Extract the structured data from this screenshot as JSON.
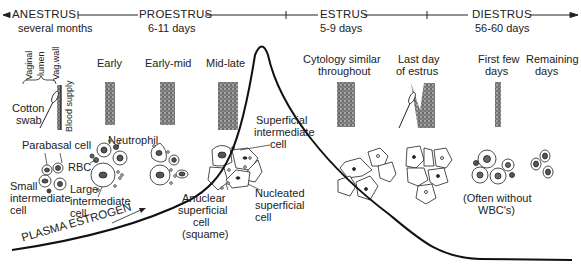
{
  "timeline": {
    "phases": [
      {
        "name": "ANESTRUS",
        "duration": "several months"
      },
      {
        "name": "PROESTRUS",
        "duration": "6-11 days"
      },
      {
        "name": "ESTRUS",
        "duration": "5-9 days"
      },
      {
        "name": "DIESTRUS",
        "duration": "56-60 days"
      }
    ]
  },
  "wall_legend": {
    "vaginal_lumen": "Vaginal lumen",
    "vaginal_lumen_l1": "Vaginal",
    "vaginal_lumen_l2": "lumen",
    "vag_wall": "Vag.wall",
    "blood_supply": "Blood supply",
    "cotton_swab_l1": "Cotton",
    "cotton_swab_l2": "swab"
  },
  "stages": [
    {
      "label_l1": "Early",
      "label_l2": ""
    },
    {
      "label_l1": "Early-mid",
      "label_l2": ""
    },
    {
      "label_l1": "Mid-late",
      "label_l2": ""
    },
    {
      "label_l1": "Cytology similar",
      "label_l2": "throughout"
    },
    {
      "label_l1": "Last day",
      "label_l2": "of estrus"
    },
    {
      "label_l1": "First few",
      "label_l2": "days"
    },
    {
      "label_l1": "Remaining",
      "label_l2": "days"
    }
  ],
  "cell_labels": {
    "parabasal": "Parabasal cell",
    "small_intermediate_l1": "Small",
    "small_intermediate_l2": "intermediate",
    "small_intermediate_l3": "cell",
    "neutrophil": "Neutrophil",
    "rbc": "RBC",
    "large_intermediate_l1": "Large",
    "large_intermediate_l2": "intermediate",
    "large_intermediate_l3": "cell",
    "superficial_intermediate_l1": "Superficial",
    "superficial_intermediate_l2": "intermediate",
    "superficial_intermediate_l3": "cell",
    "anuclear_l1": "Anuclear",
    "anuclear_l2": "superficial",
    "anuclear_l3": "cell",
    "anuclear_l4": "(squame)",
    "nucleated_l1": "Nucleated",
    "nucleated_l2": "superficial",
    "nucleated_l3": "cell",
    "diestrus_note_l1": "(Often without",
    "diestrus_note_l2": "WBC's)"
  },
  "curve": {
    "label": "PLASMA ESTROGEN",
    "color": "#111111"
  }
}
